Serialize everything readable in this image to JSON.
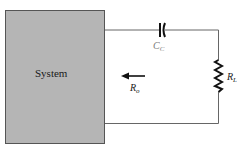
{
  "diagram": {
    "type": "circuit",
    "system_block": {
      "label": "System",
      "fill": "#b5b5b5",
      "border": "#555555"
    },
    "capacitor": {
      "symbol": "C",
      "subscript": "C",
      "color": "#7a7a7a"
    },
    "load_resistor": {
      "symbol": "R",
      "subscript": "L"
    },
    "output_resistance": {
      "symbol": "R",
      "subscript": "o",
      "arrow_direction": "left"
    },
    "wire_color": "#666666"
  }
}
